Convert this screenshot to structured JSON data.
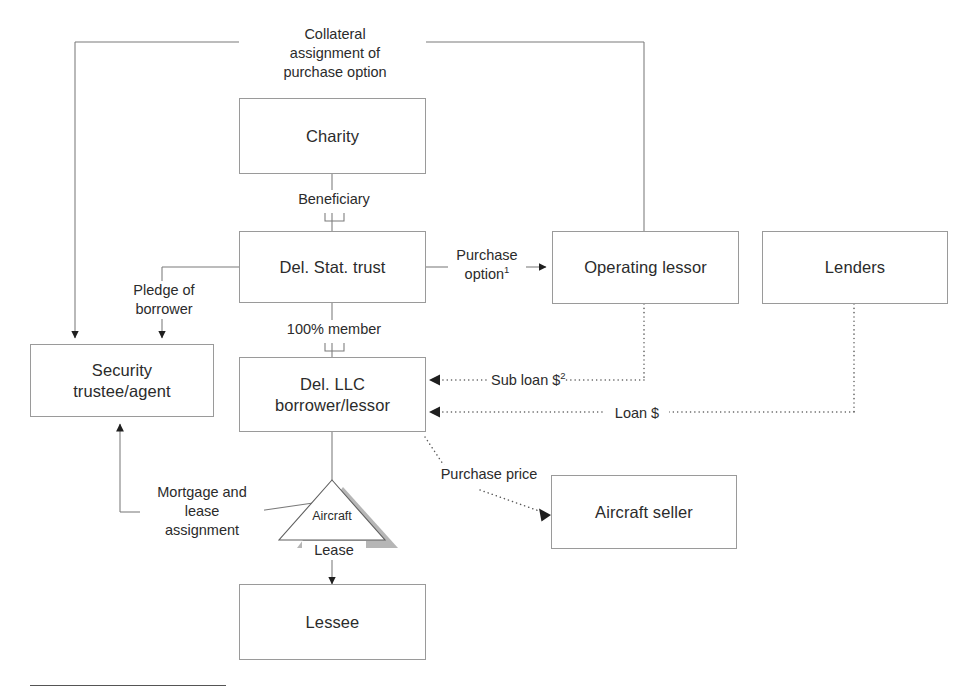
{
  "diagram": {
    "colors": {
      "box_border": "#9a9a9a",
      "line": "#6f6f6f",
      "text": "#2b2b2b",
      "triangle_shadow": "#a6a6a6",
      "background": "#ffffff"
    },
    "nodes": [
      {
        "id": "charity",
        "label": "Charity"
      },
      {
        "id": "del-stat-trust",
        "label": "Del. Stat. trust"
      },
      {
        "id": "operating-lessor",
        "label": "Operating lessor"
      },
      {
        "id": "lenders",
        "label": "Lenders"
      },
      {
        "id": "security-trustee",
        "label": "Security\ntrustee/agent",
        "line1": "Security",
        "line2": "trustee/agent"
      },
      {
        "id": "del-llc",
        "label": "Del. LLC\nborrower/lessor",
        "line1": "Del. LLC",
        "line2": "borrower/lessor"
      },
      {
        "id": "aircraft-seller",
        "label": "Aircraft seller"
      },
      {
        "id": "lessee",
        "label": "Lessee"
      }
    ],
    "shapes": [
      {
        "id": "aircraft-triangle",
        "label": "Aircraft"
      }
    ],
    "edge_labels": [
      {
        "id": "collateral-assignment",
        "line1": "Collateral",
        "line2": "assignment of",
        "line3": "purchase option"
      },
      {
        "id": "beneficiary",
        "text": "Beneficiary"
      },
      {
        "id": "purchase-option",
        "line1": "Purchase",
        "line2": "option",
        "footnote_marker": "1"
      },
      {
        "id": "pledge-of-borrower",
        "line1": "Pledge of",
        "line2": "borrower"
      },
      {
        "id": "percent-member",
        "text": "100% member"
      },
      {
        "id": "sub-loan",
        "text": "Sub loan $",
        "footnote_marker": "2"
      },
      {
        "id": "loan",
        "text": "Loan $"
      },
      {
        "id": "purchase-price",
        "text": "Purchase price"
      },
      {
        "id": "mortgage-lease-assignment",
        "line1": "Mortgage and",
        "line2": "lease",
        "line3": "assignment"
      },
      {
        "id": "lease",
        "text": "Lease"
      }
    ]
  }
}
